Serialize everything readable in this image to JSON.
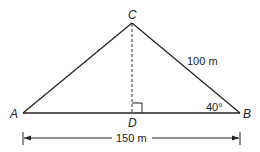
{
  "diagram": {
    "type": "triangle",
    "vertices": {
      "A": {
        "label": "A"
      },
      "B": {
        "label": "B"
      },
      "C": {
        "label": "C"
      },
      "D": {
        "label": "D"
      }
    },
    "measurements": {
      "CB": "100 m",
      "AB": "150 m",
      "angle_B": "40°"
    },
    "features": [
      "altitude CD (dashed)",
      "right angle at D"
    ]
  }
}
